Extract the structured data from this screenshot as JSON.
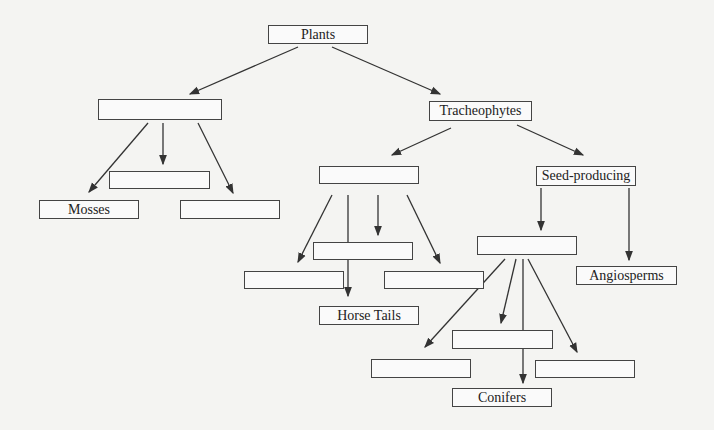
{
  "diagram": {
    "nodes": {
      "plants": "Plants",
      "bryophytes": "",
      "mosses": "Mosses",
      "bryo_mid": "",
      "bryo_right": "",
      "tracheophytes": "Tracheophytes",
      "seedless": "",
      "seed_producing": "Seed-producing",
      "seedless_mid": "",
      "seedless_left": "",
      "seedless_right": "",
      "horse_tails": "Horse Tails",
      "gymnosperms": "",
      "angiosperms": "Angiosperms",
      "gym_mid": "",
      "gym_left": "",
      "gym_right": "",
      "conifers": "Conifers"
    }
  }
}
